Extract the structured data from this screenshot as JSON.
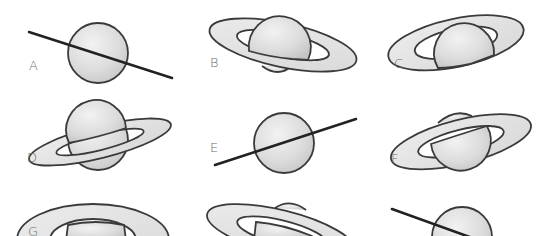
{
  "figure": {
    "colors": {
      "planet_fill_light": "#f0f0f0",
      "planet_fill_dark": "#c8c8c8",
      "ring_fill": "#e4e4e4",
      "outline": "#3a3a3a",
      "label": "#6a6a6a"
    },
    "panels": [
      {
        "id": "A",
        "label": "A",
        "ring_view": "edge-on",
        "tilt": "descending-right"
      },
      {
        "id": "B",
        "label": "B",
        "ring_view": "open",
        "tilt": "descending-right",
        "pole_visible": "south"
      },
      {
        "id": "C",
        "label": "C",
        "ring_view": "wide-open",
        "tilt": "ascending-right",
        "pole_visible": "north"
      },
      {
        "id": "D",
        "label": "D",
        "ring_view": "open",
        "tilt": "ascending-right",
        "pole_visible": "south"
      },
      {
        "id": "E",
        "label": "E",
        "ring_view": "edge-on",
        "tilt": "ascending-right"
      },
      {
        "id": "F",
        "label": "F",
        "ring_view": "open",
        "tilt": "ascending-right",
        "pole_visible": "north"
      },
      {
        "id": "G",
        "label": "G",
        "ring_view": "wide-open",
        "tilt": "level"
      },
      {
        "id": "H",
        "label": "",
        "ring_view": "open",
        "tilt": "descending-right",
        "pole_visible": "north"
      },
      {
        "id": "I",
        "label": "",
        "ring_view": "edge-on",
        "tilt": "descending-right"
      }
    ]
  }
}
